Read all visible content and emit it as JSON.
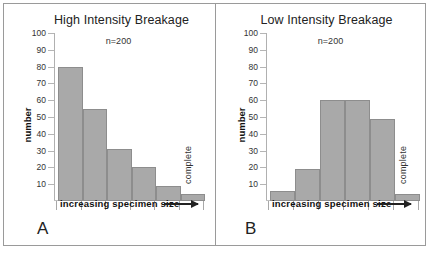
{
  "figure": {
    "background": "#ffffff",
    "frame_color": "#9a9a9a",
    "bar_fill": "#a9a9a9",
    "bar_stroke": "#8d8d8d"
  },
  "panels": [
    {
      "letter": "A",
      "title": "High Intensity Breakage",
      "annotation": "n=200",
      "ylabel": "number",
      "xlabel": "increasing specimen size",
      "last_bar_label": "complete"
    },
    {
      "letter": "B",
      "title": "Low Intensity Breakage",
      "annotation": "n=200",
      "ylabel": "number",
      "xlabel": "increasing specimen size",
      "last_bar_label": "complete"
    }
  ],
  "yticks": [
    "100",
    "90",
    "80",
    "70",
    "60",
    "50",
    "40",
    "30",
    "20",
    "10"
  ],
  "chart_data": [
    {
      "type": "bar",
      "title": "High Intensity Breakage",
      "panel": "A",
      "annotation": "n=200",
      "xlabel": "increasing specimen size",
      "ylabel": "number",
      "ylim": [
        0,
        100
      ],
      "ytick_values": [
        10,
        20,
        30,
        40,
        50,
        60,
        70,
        80,
        90,
        100
      ],
      "grid": false,
      "legend": "none",
      "categories": [
        "1",
        "2",
        "3",
        "4",
        "5",
        "6"
      ],
      "category_note": "bins of increasing specimen size; last bin labelled 'complete'",
      "values": [
        80,
        55,
        31,
        20,
        9,
        4
      ],
      "bar_labels": [
        "",
        "",
        "",
        "",
        "",
        "complete"
      ]
    },
    {
      "type": "bar",
      "title": "Low Intensity Breakage",
      "panel": "B",
      "annotation": "n=200",
      "xlabel": "increasing specimen size",
      "ylabel": "number",
      "ylim": [
        0,
        100
      ],
      "ytick_values": [
        10,
        20,
        30,
        40,
        50,
        60,
        70,
        80,
        90,
        100
      ],
      "grid": false,
      "legend": "none",
      "categories": [
        "1",
        "2",
        "3",
        "4",
        "5",
        "6"
      ],
      "category_note": "bins of increasing specimen size; last bin labelled 'complete'",
      "values": [
        6,
        19,
        60,
        60,
        49,
        4
      ],
      "bar_labels": [
        "",
        "",
        "",
        "",
        "",
        "complete"
      ]
    }
  ]
}
